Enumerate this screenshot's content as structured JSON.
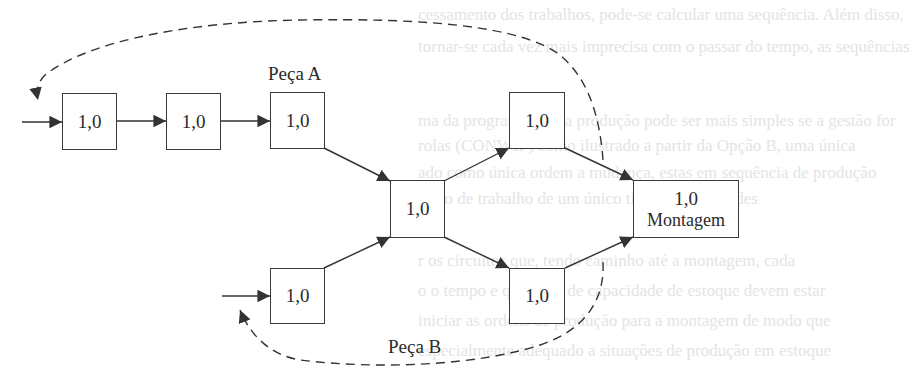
{
  "background_text": {
    "lines": [
      "cessamento dos trabalhos, pode-se calcular uma sequência. Além disso,",
      "tornar-se cada vez mais imprecisa com o passar do tempo, as sequências",
      "ma da programação da produção pode ser mais simples se a gestão for",
      "rolas (CONWIP) como ilustrado a partir da Opção B, uma única",
      "ado como única ordem a mudança, estas em sequência de produção",
      "prelo de trabalho de um único tipo de quantidades",
      "r os circuitos que, tendo caminho até a montagem, cada",
      "o o tempo e que lotes de capacidade de estoque devem estar",
      "iniciar as ordens de produção para a montagem de modo que",
      "especialmente adequado a situações de produção em estoque"
    ],
    "color": "#e4e4e4"
  },
  "diagram": {
    "part_a_label": "Peça A",
    "part_b_label": "Peça B",
    "boxes": [
      {
        "id": "a1",
        "value": "1,0"
      },
      {
        "id": "a2",
        "value": "1,0"
      },
      {
        "id": "a3",
        "value": "1,0"
      },
      {
        "id": "b1",
        "value": "1,0"
      },
      {
        "id": "merge",
        "value": "1,0"
      },
      {
        "id": "top-right",
        "value": "1,0"
      },
      {
        "id": "bottom-right",
        "value": "1,0"
      },
      {
        "id": "assembly",
        "value": "1,0",
        "sublabel": "Montagem"
      }
    ],
    "colors": {
      "line": "#333333",
      "box_border": "#3a3a3a",
      "text": "#2a2a2a"
    }
  }
}
